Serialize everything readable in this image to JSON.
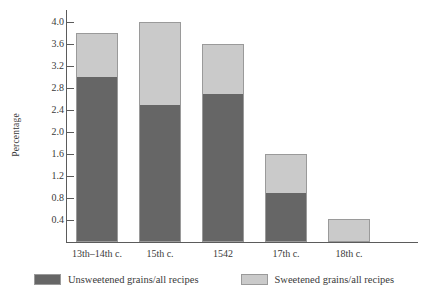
{
  "chart_data": {
    "type": "bar",
    "subtype": "stacked",
    "title": "",
    "xlabel": "",
    "ylabel": "Percentage",
    "categories": [
      "13th–14th c.",
      "15th c.",
      "1542",
      "17th c.",
      "18th c."
    ],
    "series": [
      {
        "name": "Unsweetened grains/all recipes",
        "color": "#666666",
        "values": [
          3.0,
          2.5,
          2.7,
          0.9,
          0.0
        ]
      },
      {
        "name": "Sweetened grains/all recipes",
        "color": "#cacaca",
        "values": [
          0.8,
          1.5,
          0.9,
          0.7,
          0.42
        ]
      }
    ],
    "totals": [
      3.8,
      4.0,
      3.6,
      1.6,
      0.42
    ],
    "ylim": [
      0,
      4.0
    ],
    "ytick_values": [
      0.4,
      0.8,
      1.2,
      1.6,
      2.0,
      2.4,
      2.8,
      3.2,
      3.6,
      4.0
    ],
    "ytick_labels": [
      "0.4",
      "0.8",
      "1.2",
      "1.6",
      "2.0",
      "2.4",
      "2.8",
      "3.2",
      "3.6",
      "4.0"
    ],
    "grid": false,
    "legend_position": "bottom",
    "legend": [
      "Unsweetened grains/all recipes",
      "Sweetened grains/all recipes"
    ]
  },
  "colors": {
    "unsweetened": "#666666",
    "sweetened": "#cacaca",
    "bar_border": "#9a9a9a",
    "axis": "#5b5b5b",
    "text": "#3a3a3a",
    "background": "#ffffff"
  }
}
